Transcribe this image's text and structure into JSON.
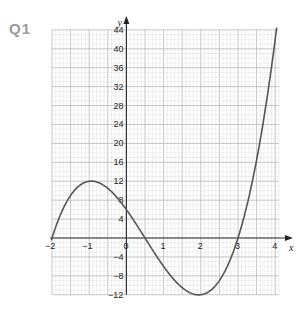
{
  "question_label": "Q1",
  "chart_data": {
    "type": "line",
    "title": "",
    "xlabel": "x",
    "ylabel": "y",
    "xlim": [
      -2,
      4.1
    ],
    "ylim": [
      -12,
      44
    ],
    "grid": true,
    "x_ticks": [
      -2,
      -1,
      0,
      1,
      2,
      3,
      4
    ],
    "y_ticks": [
      -12,
      -8,
      -4,
      4,
      8,
      12,
      16,
      20,
      24,
      28,
      32,
      36,
      40,
      44
    ],
    "x_tick_labels": [
      "-2",
      "-1",
      "0",
      "1",
      "2",
      "3",
      "4"
    ],
    "y_tick_labels": [
      "-12",
      "-8",
      "-4",
      "4",
      "8",
      "12",
      "16",
      "20",
      "24",
      "28",
      "32",
      "36",
      "40",
      "44"
    ],
    "series": [
      {
        "name": "y = (x+2)(2x-1)(x-3)",
        "x": [
          -2,
          -1.5,
          -1,
          -0.5,
          0,
          0.5,
          1,
          1.5,
          2,
          2.5,
          3,
          3.5,
          4
        ],
        "values": [
          0,
          9,
          12,
          10.5,
          6,
          0,
          -6,
          -10.5,
          -12,
          -9,
          0,
          16.5,
          42
        ]
      }
    ],
    "key_points": {
      "roots": [
        -2,
        0.5,
        3
      ],
      "y_intercept": 6,
      "local_max": [
        -1,
        12
      ],
      "local_min": [
        2,
        -12
      ]
    }
  }
}
